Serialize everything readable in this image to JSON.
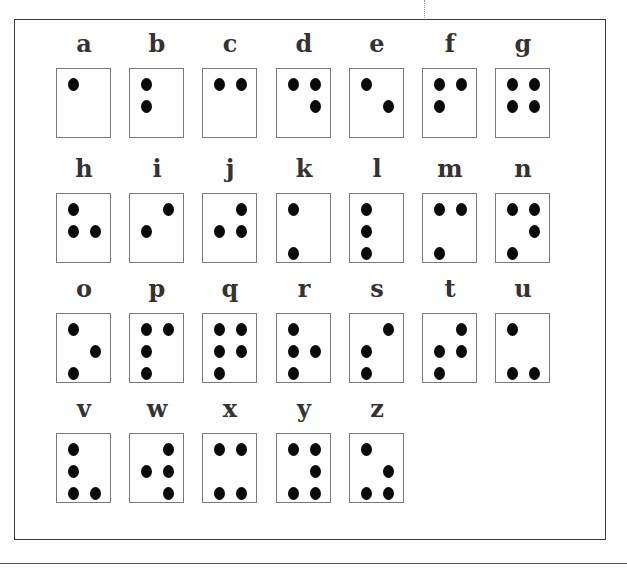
{
  "chart": {
    "dot_numbering": "1=top-left, 2=middle-left, 3=bottom-left, 4=top-right, 5=middle-right, 6=bottom-right"
  },
  "letters": [
    {
      "label": "a",
      "dots": [
        1
      ]
    },
    {
      "label": "b",
      "dots": [
        1,
        2
      ]
    },
    {
      "label": "c",
      "dots": [
        1,
        4
      ]
    },
    {
      "label": "d",
      "dots": [
        1,
        4,
        5
      ]
    },
    {
      "label": "e",
      "dots": [
        1,
        5
      ]
    },
    {
      "label": "f",
      "dots": [
        1,
        2,
        4
      ]
    },
    {
      "label": "g",
      "dots": [
        1,
        2,
        4,
        5
      ]
    },
    {
      "label": "h",
      "dots": [
        1,
        2,
        5
      ]
    },
    {
      "label": "i",
      "dots": [
        2,
        4
      ]
    },
    {
      "label": "j",
      "dots": [
        2,
        4,
        5
      ]
    },
    {
      "label": "k",
      "dots": [
        1,
        3
      ]
    },
    {
      "label": "l",
      "dots": [
        1,
        2,
        3
      ]
    },
    {
      "label": "m",
      "dots": [
        1,
        3,
        4
      ]
    },
    {
      "label": "n",
      "dots": [
        1,
        3,
        4,
        5
      ]
    },
    {
      "label": "o",
      "dots": [
        1,
        3,
        5
      ]
    },
    {
      "label": "p",
      "dots": [
        1,
        2,
        3,
        4
      ]
    },
    {
      "label": "q",
      "dots": [
        1,
        2,
        3,
        4,
        5
      ]
    },
    {
      "label": "r",
      "dots": [
        1,
        2,
        3,
        5
      ]
    },
    {
      "label": "s",
      "dots": [
        2,
        3,
        4
      ]
    },
    {
      "label": "t",
      "dots": [
        2,
        3,
        4,
        5
      ]
    },
    {
      "label": "u",
      "dots": [
        1,
        3,
        6
      ]
    },
    {
      "label": "v",
      "dots": [
        1,
        2,
        3,
        6
      ]
    },
    {
      "label": "w",
      "dots": [
        2,
        4,
        5,
        6
      ]
    },
    {
      "label": "x",
      "dots": [
        1,
        3,
        4,
        6
      ]
    },
    {
      "label": "y",
      "dots": [
        1,
        3,
        4,
        5,
        6
      ]
    },
    {
      "label": "z",
      "dots": [
        1,
        3,
        5,
        6
      ]
    }
  ],
  "layout": {
    "columns": 7,
    "rows": 4
  },
  "colors": {
    "dot": "#0a0a0a",
    "letter": "#333333",
    "box_border": "#7a7a7a",
    "frame_border": "#3a3a3a"
  }
}
